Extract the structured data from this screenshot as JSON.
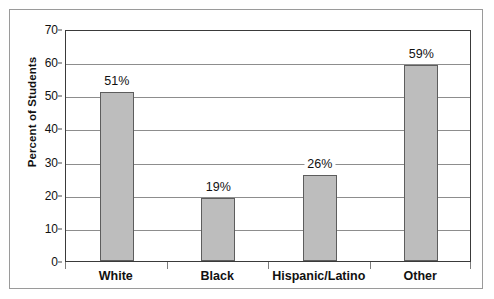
{
  "chart_data": {
    "type": "bar",
    "title": "",
    "xlabel": "",
    "ylabel": "Percent of Students",
    "ylim": [
      0,
      70
    ],
    "ytick_step": 10,
    "yticks": [
      "0",
      "10",
      "20",
      "30",
      "40",
      "50",
      "60",
      "70"
    ],
    "grid": true,
    "legend": null,
    "categories": [
      "White",
      "Black",
      "Hispanic/Latino",
      "Other"
    ],
    "values": [
      51,
      19,
      26,
      59
    ],
    "value_labels": [
      "51%",
      "19%",
      "26%",
      "59%"
    ],
    "colors": {
      "bar_fill": "#bdbdbd",
      "bar_border": "#5d5d5d",
      "gridline": "#8d8d8d",
      "axis": "#3a3a3a",
      "frame": "#9a9a9a",
      "text": "#111111",
      "background": "#ffffff"
    }
  }
}
